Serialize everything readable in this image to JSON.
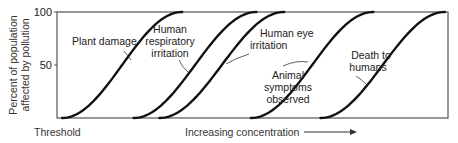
{
  "chart_data": {
    "type": "line",
    "title": "",
    "xlabel": "Increasing concentration",
    "xlabel_arrow": true,
    "x_start_label": "Threshold",
    "ylabel": "Percent of population affected by pollution",
    "ylabel_lines": [
      "Percent of population",
      "affected by pollution"
    ],
    "ylim": [
      0,
      100
    ],
    "yticks": [
      50,
      100
    ],
    "ytick_labels": [
      "50",
      "100"
    ],
    "xlim": [
      0,
      100
    ],
    "grid": false,
    "legend": "none",
    "series": [
      {
        "name": "Plant damage",
        "label_lines": [
          "Plant damage"
        ],
        "start": 1.3,
        "end": 32.0
      },
      {
        "name": "Human respiratory irritation",
        "label_lines": [
          "Human",
          "respiratory",
          "irritation"
        ],
        "start": 19.6,
        "end": 51.0
      },
      {
        "name": "Human eye irritation",
        "label_lines": [
          "Human eye",
          "irritation"
        ],
        "start": 26.2,
        "end": 58.1
      },
      {
        "name": "Animal symptoms observed",
        "label_lines": [
          "Animal",
          "symptoms",
          "observed"
        ],
        "start": 49.6,
        "end": 80.9
      },
      {
        "name": "Death to humans",
        "label_lines": [
          "Death to",
          "humans"
        ],
        "start": 67.4,
        "end": 99.2
      }
    ]
  }
}
